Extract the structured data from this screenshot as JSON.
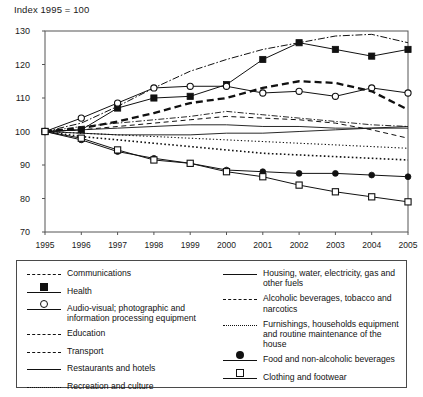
{
  "chart_data": {
    "type": "line",
    "title": "Index 1995 = 100",
    "xlabel": "",
    "ylabel": "",
    "x": [
      1995,
      1996,
      1997,
      1998,
      1999,
      2000,
      2001,
      2002,
      2003,
      2004,
      2005
    ],
    "xlim": [
      1995,
      2005
    ],
    "ylim": [
      70,
      130
    ],
    "yticks": [
      70,
      80,
      90,
      100,
      110,
      120,
      130
    ],
    "xticks": [
      "1995",
      "1996",
      "1997",
      "1998",
      "1999",
      "2000",
      "2001",
      "2002",
      "2003",
      "2004",
      "2005"
    ],
    "grid": false,
    "legend_position": "below",
    "series": [
      {
        "name": "Communications",
        "style": "dash-dot",
        "marker": "none",
        "values": [
          100,
          102.5,
          107.5,
          113,
          118,
          121.5,
          124.5,
          126.5,
          128.5,
          129,
          126.5
        ]
      },
      {
        "name": "Health",
        "style": "solid",
        "marker": "filled-square",
        "values": [
          100,
          100.5,
          107,
          110,
          110.5,
          114,
          121.5,
          126.5,
          124.5,
          122.5,
          124.5
        ]
      },
      {
        "name": "Audio-visual; photographic and information processing equipment",
        "style": "solid",
        "marker": "open-circle",
        "values": [
          100,
          104,
          108.5,
          113,
          113.5,
          113.5,
          111.5,
          112,
          110.5,
          113,
          111.5
        ]
      },
      {
        "name": "Education",
        "style": "dashed-bold",
        "marker": "none",
        "values": [
          100,
          101,
          103,
          105.5,
          108.5,
          110,
          113,
          115,
          114.5,
          112,
          106.5
        ]
      },
      {
        "name": "Transport",
        "style": "dash-dot-thin",
        "marker": "none",
        "values": [
          100,
          101.5,
          102.5,
          103.5,
          104.5,
          106,
          105,
          104,
          103,
          102,
          101.5
        ]
      },
      {
        "name": "Restaurants and hotels",
        "style": "solid-thin",
        "marker": "none",
        "values": [
          100,
          100.5,
          101,
          101.5,
          102,
          102,
          101.5,
          101.5,
          101,
          101,
          101
        ]
      },
      {
        "name": "Recreation and culture",
        "style": "dotted",
        "marker": "none",
        "values": [
          100,
          99.5,
          99,
          98.5,
          98,
          97.5,
          97,
          96.5,
          96,
          95.5,
          95
        ]
      },
      {
        "name": "Housing, water, electricity, gas and other fuels",
        "style": "solid-thin",
        "marker": "none",
        "values": [
          100,
          99.5,
          99,
          99,
          99,
          99.5,
          99.5,
          100,
          100.5,
          101,
          101.5
        ]
      },
      {
        "name": "Alcoholic beverages, tobacco and narcotics",
        "style": "dashed-thin",
        "marker": "none",
        "values": [
          100,
          100.5,
          101.5,
          102.5,
          103.5,
          104.5,
          104,
          103.5,
          102.5,
          100.5,
          98
        ]
      },
      {
        "name": "Furnishings, households equipment and routine maintenance of the house",
        "style": "dotted-bold",
        "marker": "none",
        "values": [
          100,
          98.5,
          97.5,
          96.5,
          95.5,
          94.5,
          93.5,
          93,
          92.5,
          92,
          91.5
        ]
      },
      {
        "name": "Food and non-alcoholic beverages",
        "style": "solid",
        "marker": "filled-circle",
        "values": [
          100,
          97.5,
          94,
          92,
          90.5,
          88.5,
          88,
          87.5,
          87.5,
          87,
          86.5
        ]
      },
      {
        "name": "Clothing and footwear",
        "style": "solid",
        "marker": "open-square",
        "values": [
          100,
          98,
          94.5,
          91.5,
          90.5,
          88,
          86.5,
          84,
          82,
          80.5,
          79
        ]
      }
    ]
  },
  "legend": {
    "left": [
      {
        "label": "Communications",
        "key": "dash-dot"
      },
      {
        "label": "Health",
        "key": "marker-filled-square"
      },
      {
        "label": "Audio-visual; photographic and information processing equipment",
        "key": "marker-open-circle"
      },
      {
        "label": "Education",
        "key": "dash-bold"
      },
      {
        "label": "Transport",
        "key": "dash-dot-thin"
      },
      {
        "label": "Restaurants and hotels",
        "key": "solid"
      },
      {
        "label": "Recreation and culture",
        "key": "dotted"
      }
    ],
    "right": [
      {
        "label": "Housing, water, electricity, gas and other fuels",
        "key": "solid"
      },
      {
        "label": "Alcoholic beverages, tobacco and narcotics",
        "key": "dashed-thin"
      },
      {
        "label": "Furnishings, households equipment and routine maintenance of the house",
        "key": "dotted-bold"
      },
      {
        "label": "Food and non-alcoholic beverages",
        "key": "marker-filled-circle"
      },
      {
        "label": "Clothing and footwear",
        "key": "marker-open-square"
      }
    ]
  }
}
